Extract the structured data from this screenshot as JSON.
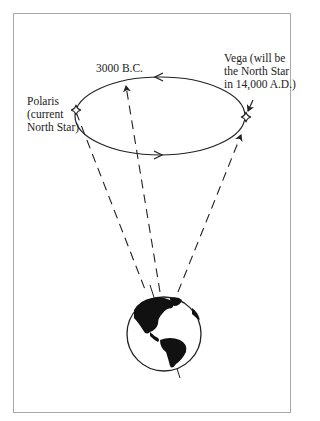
{
  "diagram": {
    "labels": {
      "polaris": "Polaris\n(current\nNorth Star)",
      "bc3000": "3000 B.C.",
      "vega": "Vega (will be\nthe North Star\nin 14,000 A.D.)"
    },
    "nodes": [
      {
        "id": "polaris",
        "label": "Polaris (current North Star)",
        "type": "star"
      },
      {
        "id": "bc3000",
        "label": "3000 B.C.",
        "type": "point"
      },
      {
        "id": "vega",
        "label": "Vega (will be the North Star in 14,000 A.D.)",
        "type": "star"
      },
      {
        "id": "earth",
        "label": "",
        "type": "globe"
      }
    ],
    "edges": [
      {
        "from": "earth",
        "to": "polaris",
        "style": "dashed"
      },
      {
        "from": "earth",
        "to": "bc3000",
        "style": "dashed",
        "arrow": true
      },
      {
        "from": "earth",
        "to": "vega",
        "style": "dashed",
        "arrow": true
      },
      {
        "from": "precession-ellipse",
        "direction": "counterclockwise-arrows",
        "style": "solid"
      }
    ],
    "colors": {
      "line": "#222222",
      "frame": "#a8a8a8",
      "background": "#ffffff"
    }
  }
}
